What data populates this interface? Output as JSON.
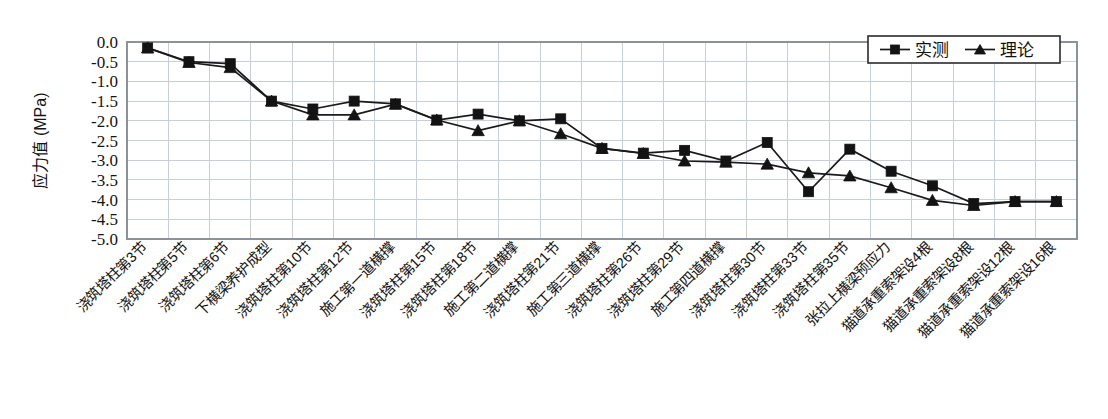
{
  "chart_data": {
    "type": "line",
    "title": "",
    "xlabel": "",
    "ylabel": "应力值 (MPa)",
    "ylim": [
      -5.0,
      0.0
    ],
    "yticks": [
      "0.0",
      "-0.5",
      "-1.0",
      "-1.5",
      "-2.0",
      "-2.5",
      "-3.0",
      "-3.5",
      "-4.0",
      "-4.5",
      "-5.0"
    ],
    "ytick_values": [
      0.0,
      -0.5,
      -1.0,
      -1.5,
      -2.0,
      -2.5,
      -3.0,
      -3.5,
      -4.0,
      -4.5,
      -5.0
    ],
    "grid": true,
    "legend_position": "top-right",
    "categories": [
      "浇筑塔柱第3节",
      "浇筑塔柱第5节",
      "浇筑塔柱第6节",
      "下横梁养护成型",
      "浇筑塔柱第10节",
      "浇筑塔柱第12节",
      "施工第一道横撑",
      "浇筑塔柱第15节",
      "浇筑塔柱第18节",
      "施工第二道横撑",
      "浇筑塔柱第21节",
      "施工第三道横撑",
      "浇筑塔柱第26节",
      "浇筑塔柱第29节",
      "施工第四道横撑",
      "浇筑塔柱第30节",
      "浇筑塔柱第33节",
      "浇筑塔柱第35节",
      "张拉上横梁预应力",
      "猫道承重索架设4根",
      "猫道承重索架设8根",
      "猫道承重索架设12根",
      "猫道承重索架设16根"
    ],
    "series": [
      {
        "name": "实测",
        "marker": "square",
        "values": [
          -0.15,
          -0.5,
          -0.55,
          -1.5,
          -1.7,
          -1.5,
          -1.57,
          -1.98,
          -1.83,
          -2.0,
          -1.95,
          -2.7,
          -2.82,
          -2.75,
          -3.02,
          -2.55,
          -3.8,
          -2.72,
          -3.28,
          -3.65,
          -4.1,
          -4.05,
          -4.05
        ]
      },
      {
        "name": "理论",
        "marker": "triangle",
        "values": [
          -0.15,
          -0.52,
          -0.65,
          -1.5,
          -1.85,
          -1.85,
          -1.58,
          -1.98,
          -2.25,
          -2.0,
          -2.33,
          -2.7,
          -2.83,
          -3.02,
          -3.05,
          -3.1,
          -3.32,
          -3.4,
          -3.7,
          -4.02,
          -4.15,
          -4.05,
          -4.05
        ]
      }
    ],
    "legend": [
      {
        "label": "实测",
        "marker": "square"
      },
      {
        "label": "理论",
        "marker": "triangle"
      }
    ]
  }
}
